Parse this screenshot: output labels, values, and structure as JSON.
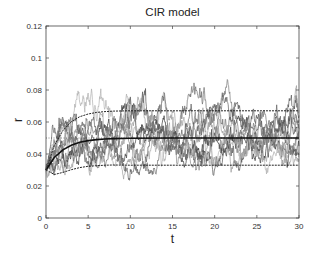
{
  "chart_data": {
    "type": "line",
    "title": "CIR model",
    "xlabel": "t",
    "ylabel": "r",
    "xlim": [
      0,
      30
    ],
    "ylim": [
      0,
      0.12
    ],
    "xticks": [
      0,
      5,
      10,
      15,
      20,
      25,
      30
    ],
    "xtick_labels": [
      "0",
      "5",
      "10",
      "15",
      "20",
      "25",
      "30"
    ],
    "yticks": [
      0,
      0.02,
      0.04,
      0.06,
      0.08,
      0.1,
      0.12
    ],
    "ytick_labels": [
      "0",
      "0.02",
      "0.04",
      "0.06",
      "0.08",
      "0.1",
      "0.12"
    ],
    "grid": false,
    "legend": null,
    "model": {
      "r0": 0.03,
      "long_run_mean": 0.05,
      "mean_reversion_speed": 0.5,
      "num_simulated_paths": 10,
      "upper_band_limit": 0.067,
      "lower_band_limit": 0.033
    },
    "series": [
      {
        "name": "long-run mean level",
        "style": "dotted",
        "color": "#555555",
        "x": [
          0,
          30
        ],
        "y": [
          0.05,
          0.05
        ]
      },
      {
        "name": "expected value",
        "style": "solid-thick",
        "color": "#111111",
        "x": [
          0,
          1,
          2,
          3,
          4,
          5,
          6,
          7,
          8,
          10,
          15,
          20,
          25,
          30
        ],
        "y": [
          0.03,
          0.0379,
          0.0426,
          0.0455,
          0.0473,
          0.0484,
          0.049,
          0.0494,
          0.0496,
          0.0499,
          0.05,
          0.05,
          0.05,
          0.05
        ]
      },
      {
        "name": "upper confidence band",
        "style": "dashed",
        "color": "#222222",
        "x": [
          0,
          1,
          2,
          3,
          4,
          5,
          6,
          7,
          8,
          10,
          15,
          20,
          25,
          30
        ],
        "y": [
          0.03,
          0.0455,
          0.0547,
          0.0602,
          0.0633,
          0.065,
          0.066,
          0.0665,
          0.0668,
          0.067,
          0.067,
          0.067,
          0.067,
          0.067
        ]
      },
      {
        "name": "lower confidence band",
        "style": "dashed",
        "color": "#222222",
        "x": [
          0,
          1,
          2,
          3,
          4,
          5,
          6,
          7,
          8,
          10,
          15,
          20,
          25,
          30
        ],
        "y": [
          0.03,
          0.0272,
          0.0285,
          0.0302,
          0.0315,
          0.0323,
          0.0327,
          0.033,
          0.0331,
          0.033,
          0.033,
          0.033,
          0.033,
          0.033
        ]
      }
    ],
    "simulated_path_notes": "Approximately 10 gray stochastic trajectories starting at r=0.03, fluctuating mostly between 0.01 and 0.12; notable peaks near t=12 (~0.105), t=15-17 (~0.12+), and t=25 (~0.12)."
  },
  "colors": {
    "path_grays": [
      "#3a3a3a",
      "#555555",
      "#6e6e6e",
      "#888888",
      "#9c9c9c",
      "#b0b0b0",
      "#4a4a4a",
      "#7a7a7a",
      "#a2a2a2",
      "#616161"
    ]
  }
}
